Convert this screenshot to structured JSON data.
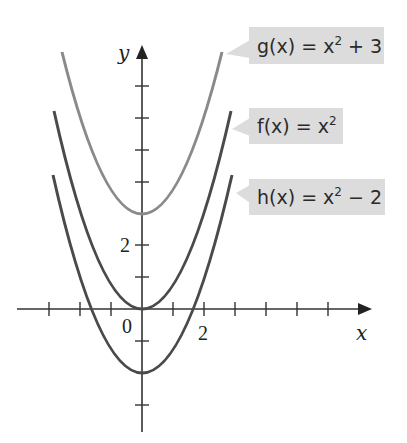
{
  "figure": {
    "axes": {
      "x_label": "x",
      "y_label": "y",
      "origin_label": "0",
      "x_tick_label": "2",
      "y_tick_label": "2",
      "x_ticks": [
        -3,
        -2,
        -1,
        1,
        2,
        3,
        4,
        5,
        6,
        7
      ],
      "y_ticks": [
        -3,
        -2,
        -1,
        1,
        2,
        3,
        4,
        5,
        6
      ]
    },
    "curves": [
      {
        "name": "g",
        "label_prefix": "g(x) = x",
        "label_exp": "2",
        "label_suffix": " + 3",
        "shift": 3,
        "color": "#8a8a8a"
      },
      {
        "name": "f",
        "label_prefix": "f(x) = x",
        "label_exp": "2",
        "label_suffix": "",
        "shift": 0,
        "color": "#4a4a4a"
      },
      {
        "name": "h",
        "label_prefix": "h(x) = x",
        "label_exp": "2",
        "label_suffix": " − 2",
        "shift": -2,
        "color": "#4a4a4a"
      }
    ],
    "label_box_color": "#dcdcdc"
  }
}
